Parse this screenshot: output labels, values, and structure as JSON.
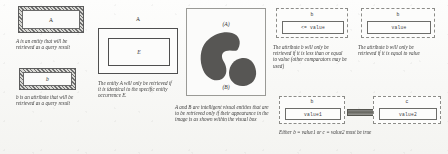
{
  "figure": {
    "background_color": "#f8f8f6",
    "ink_color": "#3a3a3a"
  },
  "panels": [
    {
      "id": "panel-entity-attribute",
      "items": [
        {
          "box_label": "A",
          "style": "hatched-border",
          "caption": "A is an entity that will be retrieved as a query result"
        },
        {
          "box_label": "b",
          "style": "hatched-border",
          "caption": "b is an attribute that will be retrieved as a query result"
        }
      ]
    },
    {
      "id": "panel-entity-occurrence",
      "outer_label": "A",
      "inner_label": "E",
      "caption": "The entity A will only be retrieved if it is identical to the specific entity occurrence E."
    },
    {
      "id": "panel-visual-entities",
      "label_a": "(A)",
      "label_b": "(B)",
      "caption": "A and B are intelligent visual entities that are to be retrieved only if their appearance in the image is as shown within the visual box"
    },
    {
      "id": "panel-comparator",
      "attribute": "b",
      "expression": "<= value",
      "caption": "The attribute b will only be retrieved if it is less than or equal to value (other comparators may be used)"
    },
    {
      "id": "panel-equality",
      "attribute": "b",
      "expression": "value",
      "caption": "The attribute b will only be retrieved if it is equal to value"
    },
    {
      "id": "panel-disjunction",
      "left_attribute": "b",
      "left_value": "value1",
      "right_attribute": "c",
      "right_value": "value2",
      "caption": "Either b = value1 or c = value2 must be true"
    }
  ]
}
